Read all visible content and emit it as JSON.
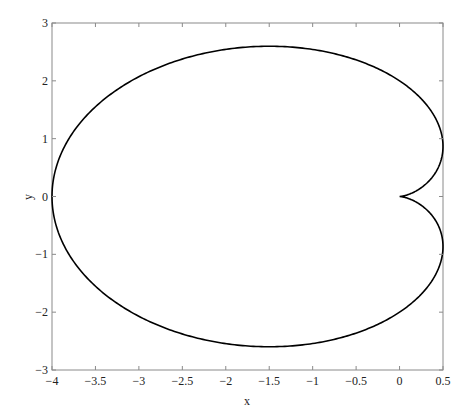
{
  "chart_data": {
    "type": "line",
    "title": "",
    "xlabel": "x",
    "ylabel": "y",
    "xlim": [
      -4,
      0.5
    ],
    "ylim": [
      -3,
      3
    ],
    "grid": false,
    "legend": null,
    "xticks": [
      -4,
      -3.5,
      -3,
      -2.5,
      -2,
      -1.5,
      -1,
      -0.5,
      0,
      0.5
    ],
    "xtick_labels": [
      "−4",
      "−3.5",
      "−3",
      "−2.5",
      "−2",
      "−1.5",
      "−1",
      "−0.5",
      "0",
      "0.5"
    ],
    "yticks": [
      -3,
      -2,
      -1,
      0,
      1,
      2,
      3
    ],
    "ytick_labels": [
      "−3",
      "−2",
      "−1",
      "0",
      "1",
      "2",
      "3"
    ],
    "series": [
      {
        "name": "cardioid",
        "description": "Parametric curve r = 2(1 - cosθ), x = r cosθ, y = r sinθ",
        "color": "#000000",
        "key_points": [
          {
            "x": 0,
            "y": 0,
            "note": "cusp"
          },
          {
            "x": 0.5,
            "y": 0.866
          },
          {
            "x": -1.5,
            "y": 2.598,
            "note": "max y"
          },
          {
            "x": -4,
            "y": 0,
            "note": "min x"
          },
          {
            "x": -1.5,
            "y": -2.598,
            "note": "min y"
          },
          {
            "x": 0.5,
            "y": -0.866
          }
        ]
      }
    ]
  }
}
